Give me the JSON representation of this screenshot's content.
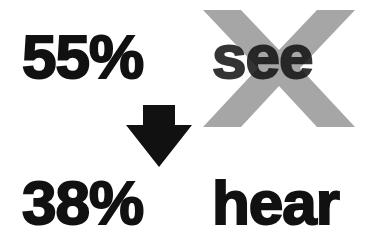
{
  "top_row": {
    "percent": "55%",
    "word": "see"
  },
  "bottom_row": {
    "percent": "38%",
    "word": "hear"
  },
  "icons": {
    "cross": "x-mark-icon",
    "arrow": "arrow-down-icon"
  },
  "colors": {
    "text": "#111111",
    "cross": "#a6a6a6",
    "background": "#ffffff"
  }
}
